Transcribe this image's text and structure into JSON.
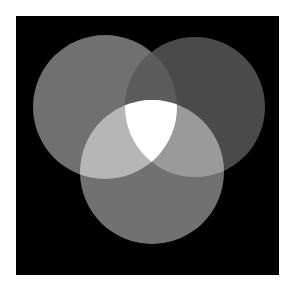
{
  "diagram": {
    "type": "three-circle-venn",
    "background": "#000000",
    "canvas": {
      "x": 16,
      "y": 16,
      "width": 263,
      "height": 259
    },
    "circles": [
      {
        "name": "top-left",
        "cx": 105,
        "cy": 107,
        "r": 72,
        "color": "#707070"
      },
      {
        "name": "top-right",
        "cx": 195,
        "cy": 107,
        "r": 70,
        "color": "#4a4a4a"
      },
      {
        "name": "bottom",
        "cx": 152,
        "cy": 172,
        "r": 72,
        "color": "#717171"
      }
    ],
    "overlaps": {
      "top-left_top-right": "#5c5c5c",
      "top-left_bottom": "#b6b6b6",
      "top-right_bottom": "#9a9a9a",
      "all": "#ffffff"
    }
  }
}
